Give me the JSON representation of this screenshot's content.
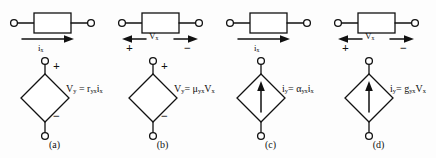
{
  "figure": {
    "type": "circuit-diagram",
    "background_color": "#fdfdfd",
    "line_color": "#111111"
  },
  "panels": [
    {
      "id": "a",
      "caption": "(a)",
      "source_kind": "voltage",
      "source_symbol": "diamond",
      "control_label": "i",
      "control_sub": "x",
      "control_arrow": "right",
      "polarity_top": "+",
      "polarity_bottom": "−",
      "equation": {
        "output": "V",
        "output_sub": "y",
        "equals": "=",
        "coefficient": "r",
        "coefficient_sub": "yx",
        "operand": "i",
        "operand_sub": "x",
        "full_text": "V_y = r_yx i_x"
      }
    },
    {
      "id": "b",
      "caption": "(b)",
      "source_kind": "voltage",
      "source_symbol": "diamond",
      "control_label": "V",
      "control_sub": "x",
      "control_arrow": "double",
      "control_plus": "+",
      "control_minus": "−",
      "polarity_top": "+",
      "polarity_bottom": "−",
      "equation": {
        "output": "V",
        "output_sub": "y",
        "equals": "=",
        "coefficient": "μ",
        "coefficient_sub": "yx",
        "operand": "V",
        "operand_sub": "x",
        "full_text": "V_y = μ_yx V_x"
      }
    },
    {
      "id": "c",
      "caption": "(c)",
      "source_kind": "current",
      "source_symbol": "diamond-with-arrow",
      "control_label": "i",
      "control_sub": "x",
      "control_arrow": "right",
      "equation": {
        "output": "i",
        "output_sub": "y",
        "equals": "=",
        "coefficient": "α",
        "coefficient_sub": "yx",
        "operand": "i",
        "operand_sub": "x",
        "full_text": "i_y = α_yx i_x"
      }
    },
    {
      "id": "d",
      "caption": "(d)",
      "source_kind": "current",
      "source_symbol": "diamond-with-arrow",
      "control_label": "V",
      "control_sub": "x",
      "control_arrow": "double",
      "control_plus": "+",
      "control_minus": "−",
      "equation": {
        "output": "i",
        "output_sub": "y",
        "equals": "=",
        "coefficient": "g",
        "coefficient_sub": "yx",
        "operand": "V",
        "operand_sub": "x",
        "full_text": "i_y = g_yx V_x"
      }
    }
  ]
}
